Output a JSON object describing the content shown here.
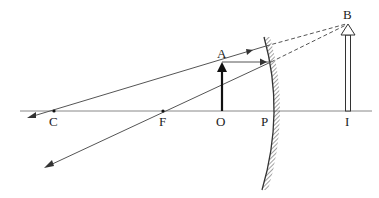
{
  "diagram": {
    "type": "ray-diagram",
    "colors": {
      "line": "#555555",
      "axis": "#777777",
      "ink": "#111111",
      "background": "#ffffff"
    },
    "labels": {
      "C": "C",
      "F": "F",
      "O": "O",
      "P": "P",
      "I": "I",
      "A": "A",
      "B": "B"
    },
    "points": {
      "C": [
        54,
        111
      ],
      "F": [
        163,
        111
      ],
      "O": [
        222,
        111
      ],
      "P": [
        268,
        111
      ],
      "I": [
        348,
        111
      ],
      "A": [
        222,
        62
      ],
      "B": [
        348,
        23
      ]
    }
  }
}
